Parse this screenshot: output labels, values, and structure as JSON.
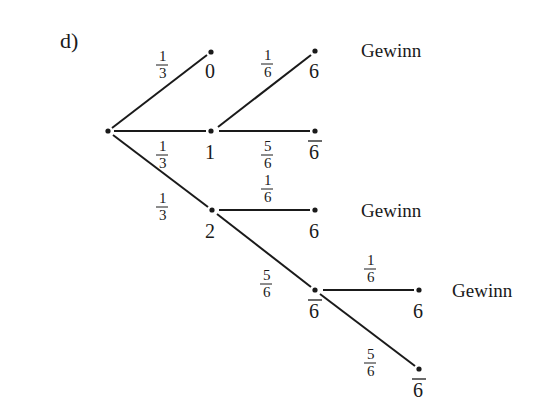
{
  "part_label": "d)",
  "outcome_text": "Gewinn",
  "nodes": {
    "root": {
      "x": 108,
      "y": 131,
      "label": ""
    },
    "n0": {
      "x": 211,
      "y": 52,
      "label": "0"
    },
    "n1": {
      "x": 211,
      "y": 131,
      "label": "1"
    },
    "n2": {
      "x": 212,
      "y": 210,
      "label": "2"
    },
    "n1_six": {
      "x": 315,
      "y": 51,
      "label": "6"
    },
    "n1_not": {
      "x": 315,
      "y": 131,
      "label": "6",
      "overline": true
    },
    "n2_six": {
      "x": 315,
      "y": 210,
      "label": "6"
    },
    "n2_not": {
      "x": 315,
      "y": 290,
      "label": "6",
      "overline": true
    },
    "n3_six": {
      "x": 419,
      "y": 290,
      "label": "6"
    },
    "n3_not": {
      "x": 419,
      "y": 369,
      "label": "6",
      "overline": true
    }
  },
  "edges": [
    {
      "from": "root",
      "to": "n0",
      "prob": {
        "num": "1",
        "den": "3"
      }
    },
    {
      "from": "root",
      "to": "n1",
      "prob": {
        "num": "1",
        "den": "3"
      }
    },
    {
      "from": "root",
      "to": "n2",
      "prob": {
        "num": "1",
        "den": "3"
      }
    },
    {
      "from": "n1",
      "to": "n1_six",
      "prob": {
        "num": "1",
        "den": "6"
      }
    },
    {
      "from": "n1",
      "to": "n1_not",
      "prob": {
        "num": "5",
        "den": "6"
      }
    },
    {
      "from": "n2",
      "to": "n2_six",
      "prob": {
        "num": "1",
        "den": "6"
      }
    },
    {
      "from": "n2",
      "to": "n2_not",
      "prob": {
        "num": "5",
        "den": "6"
      }
    },
    {
      "from": "n2_not",
      "to": "n3_six",
      "prob": {
        "num": "1",
        "den": "6"
      }
    },
    {
      "from": "n2_not",
      "to": "n3_not",
      "prob": {
        "num": "5",
        "den": "6"
      }
    }
  ],
  "outcomes": [
    {
      "node": "n1_six",
      "text": "Gewinn"
    },
    {
      "node": "n2_six",
      "text": "Gewinn"
    },
    {
      "node": "n3_six",
      "text": "Gewinn"
    }
  ]
}
